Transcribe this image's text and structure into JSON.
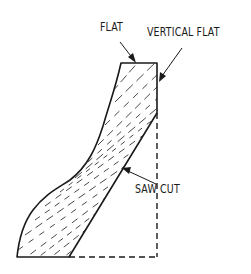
{
  "diagram": {
    "type": "technical-sketch",
    "labels": {
      "flat": "FLAT",
      "vertical_flat": "VERTICAL FLAT",
      "saw_cut": "SAW CUT"
    },
    "colors": {
      "line": "#1a1a1a",
      "hatch": "#333333",
      "background": "#ffffff"
    }
  }
}
